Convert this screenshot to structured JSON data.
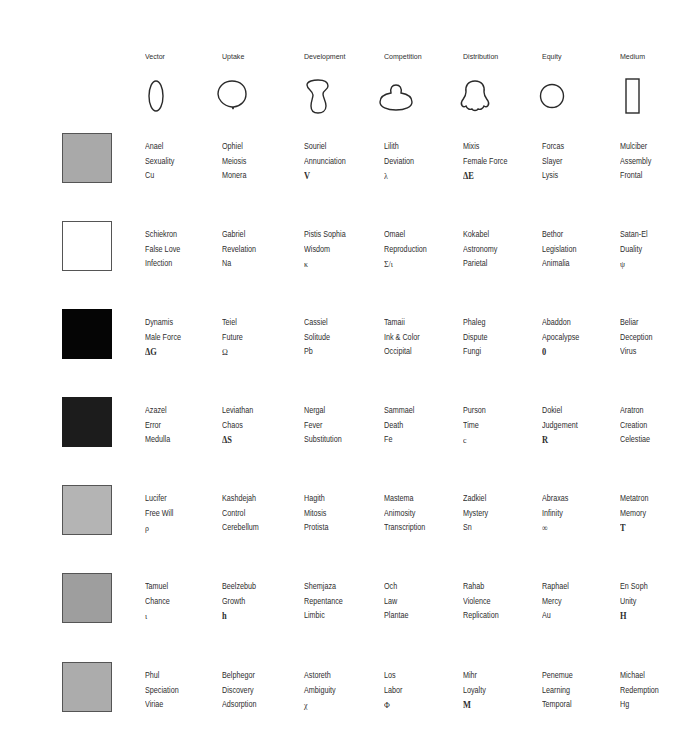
{
  "columns": [
    {
      "label": "Vector",
      "shape": "tall-ellipse-icon"
    },
    {
      "label": "Uptake",
      "shape": "round-bulb-icon"
    },
    {
      "label": "Development",
      "shape": "peanut-icon"
    },
    {
      "label": "Competition",
      "shape": "budding-ellipse-icon"
    },
    {
      "label": "Distribution",
      "shape": "bell-lobed-icon"
    },
    {
      "label": "Equity",
      "shape": "circle-icon"
    },
    {
      "label": "Medium",
      "shape": "tall-rectangle-icon"
    }
  ],
  "rows": [
    {
      "swatch": {
        "name": "gray-swatch",
        "fill": "#a9a9a9",
        "border": "#555555"
      },
      "cells": [
        [
          "Anael",
          "Sexuality",
          "Cu"
        ],
        [
          "Ophiel",
          "Meiosis",
          "Monera"
        ],
        [
          "Souriel",
          "Annunciation",
          "V"
        ],
        [
          "Lilith",
          "Deviation",
          "λ"
        ],
        [
          "Mixis",
          "Female Force",
          "ΔE"
        ],
        [
          "Forcas",
          "Slayer",
          "Lysis"
        ],
        [
          "Mulciber",
          "Assembly",
          "Frontal"
        ]
      ]
    },
    {
      "swatch": {
        "name": "white-swatch",
        "fill": "#ffffff",
        "border": "#555555"
      },
      "cells": [
        [
          "Schiekron",
          "False Love",
          "Infection"
        ],
        [
          "Gabriel",
          "Revelation",
          "Na"
        ],
        [
          "Pistis Sophia",
          "Wisdom",
          "κ"
        ],
        [
          "Omael",
          "Reproduction",
          "Σ/ι"
        ],
        [
          "Kokabel",
          "Astronomy",
          "Parietal"
        ],
        [
          "Bethor",
          "Legislation",
          "Animalia"
        ],
        [
          "Satan-El",
          "Duality",
          "ψ"
        ]
      ]
    },
    {
      "swatch": {
        "name": "black-swatch",
        "fill": "#050505",
        "border": "#050505"
      },
      "cells": [
        [
          "Dynamis",
          "Male Force",
          "ΔG"
        ],
        [
          "Teiel",
          "Future",
          "Ω"
        ],
        [
          "Cassiel",
          "Solitude",
          "Pb"
        ],
        [
          "Tamaii",
          "Ink & Color",
          "Occipital"
        ],
        [
          "Phaleg",
          "Dispute",
          "Fungi"
        ],
        [
          "Abaddon",
          "Apocalypse",
          "0"
        ],
        [
          "Beliar",
          "Deception",
          "Virus"
        ]
      ]
    },
    {
      "swatch": {
        "name": "charcoal-swatch",
        "fill": "#1c1c1c",
        "border": "#1c1c1c"
      },
      "cells": [
        [
          "Azazel",
          "Error",
          "Medulla"
        ],
        [
          "Leviathan",
          "Chaos",
          "ΔS"
        ],
        [
          "Nergal",
          "Fever",
          "Substitution"
        ],
        [
          "Sammael",
          "Death",
          "Fe"
        ],
        [
          "Purson",
          "Time",
          "c"
        ],
        [
          "Dokiel",
          "Judgement",
          "R"
        ],
        [
          "Aratron",
          "Creation",
          "Celestiae"
        ]
      ]
    },
    {
      "swatch": {
        "name": "light-gray-swatch",
        "fill": "#b4b4b4",
        "border": "#555555"
      },
      "cells": [
        [
          "Lucifer",
          "Free Will",
          "ρ"
        ],
        [
          "Kashdejah",
          "Control",
          "Cerebellum"
        ],
        [
          "Hagith",
          "Mitosis",
          "Protista"
        ],
        [
          "Mastema",
          "Animosity",
          "Transcription"
        ],
        [
          "Zadkiel",
          "Mystery",
          "Sn"
        ],
        [
          "Abraxas",
          "Infinity",
          "∞"
        ],
        [
          "Metatron",
          "Memory",
          "T"
        ]
      ]
    },
    {
      "swatch": {
        "name": "mid-gray-swatch",
        "fill": "#9e9e9e",
        "border": "#555555"
      },
      "cells": [
        [
          "Tamuel",
          "Chance",
          "ι"
        ],
        [
          "Beelzebub",
          "Growth",
          "h"
        ],
        [
          "Shemjaza",
          "Repentance",
          "Limbic"
        ],
        [
          "Och",
          "Law",
          "Plantae"
        ],
        [
          "Rahab",
          "Violence",
          "Replication"
        ],
        [
          "Raphael",
          "Mercy",
          "Au"
        ],
        [
          "En Soph",
          "Unity",
          "H"
        ]
      ]
    },
    {
      "swatch": {
        "name": "silver-gray-swatch",
        "fill": "#acacac",
        "border": "#555555"
      },
      "cells": [
        [
          "Phul",
          "Speciation",
          "Viriae"
        ],
        [
          "Belphegor",
          "Discovery",
          "Adsorption"
        ],
        [
          "Astoreth",
          "Ambiguity",
          "χ"
        ],
        [
          "Los",
          "Labor",
          "Φ"
        ],
        [
          "Mihr",
          "Loyalty",
          "M"
        ],
        [
          "Penemue",
          "Learning",
          "Temporal"
        ],
        [
          "Michael",
          "Redemption",
          "Hg"
        ]
      ]
    }
  ]
}
